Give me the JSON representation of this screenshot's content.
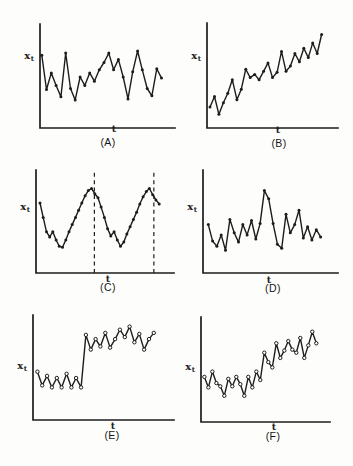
{
  "figure": {
    "caption_fragment": "Figure",
    "ink_color": "#1d1d1d",
    "background_color": "#fdfdfc"
  },
  "chart_data": [
    {
      "panel": "A",
      "panel_label": "(A)",
      "type": "line",
      "xlabel": "t",
      "ylabel": "xt",
      "ylabel_base": "x",
      "ylabel_sub": "t",
      "marker": "filled-dot",
      "grid": false,
      "coords": "fractions of axis: x 0=origin to 1=right end, y 0=baseline to 1=axis top",
      "axis": {
        "x_left": 40,
        "y_top": 24,
        "y_bottom": 128,
        "x_right": 175
      },
      "x": [
        0.013,
        0.048,
        0.084,
        0.119,
        0.155,
        0.19,
        0.226,
        0.261,
        0.297,
        0.332,
        0.368,
        0.403,
        0.439,
        0.474,
        0.51,
        0.545,
        0.581,
        0.616,
        0.652,
        0.687,
        0.723,
        0.758,
        0.794,
        0.829,
        0.865,
        0.9
      ],
      "y": [
        0.7,
        0.37,
        0.53,
        0.41,
        0.3,
        0.72,
        0.38,
        0.27,
        0.49,
        0.41,
        0.53,
        0.45,
        0.56,
        0.63,
        0.72,
        0.56,
        0.66,
        0.49,
        0.28,
        0.54,
        0.74,
        0.56,
        0.38,
        0.31,
        0.57,
        0.48
      ]
    },
    {
      "panel": "B",
      "panel_label": "(B)",
      "type": "line",
      "xlabel": "t",
      "ylabel": "xt",
      "ylabel_base": "x",
      "ylabel_sub": "t",
      "marker": "filled-dot",
      "grid": false,
      "axis": {
        "x_left": 207,
        "y_top": 23,
        "y_bottom": 128,
        "x_right": 338
      },
      "x": [
        0.023,
        0.057,
        0.091,
        0.125,
        0.159,
        0.193,
        0.228,
        0.262,
        0.296,
        0.33,
        0.364,
        0.398,
        0.432,
        0.466,
        0.5,
        0.535,
        0.569,
        0.603,
        0.637,
        0.671,
        0.705,
        0.739,
        0.773,
        0.807,
        0.841,
        0.875
      ],
      "y": [
        0.2,
        0.3,
        0.13,
        0.24,
        0.33,
        0.46,
        0.27,
        0.37,
        0.56,
        0.48,
        0.51,
        0.46,
        0.54,
        0.62,
        0.48,
        0.53,
        0.73,
        0.54,
        0.59,
        0.71,
        0.63,
        0.76,
        0.67,
        0.81,
        0.71,
        0.89
      ]
    },
    {
      "panel": "C",
      "panel_label": "(C)",
      "type": "line",
      "xlabel": "t",
      "ylabel": "xt",
      "ylabel_base": "x",
      "ylabel_sub": "t",
      "marker": "filled-dot",
      "grid": false,
      "dashed_lines_x": [
        0.423,
        0.854
      ],
      "axis": {
        "x_left": 36,
        "y_top": 170,
        "y_bottom": 273,
        "x_right": 174
      },
      "x": [
        0.029,
        0.052,
        0.076,
        0.099,
        0.122,
        0.146,
        0.169,
        0.192,
        0.216,
        0.239,
        0.262,
        0.286,
        0.309,
        0.332,
        0.356,
        0.379,
        0.402,
        0.426,
        0.449,
        0.472,
        0.496,
        0.519,
        0.542,
        0.566,
        0.589,
        0.612,
        0.636,
        0.659,
        0.682,
        0.706,
        0.729,
        0.752,
        0.776,
        0.799,
        0.822,
        0.846,
        0.869,
        0.893
      ],
      "y": [
        0.68,
        0.54,
        0.4,
        0.35,
        0.4,
        0.32,
        0.26,
        0.25,
        0.32,
        0.4,
        0.47,
        0.54,
        0.61,
        0.68,
        0.75,
        0.8,
        0.82,
        0.77,
        0.73,
        0.64,
        0.54,
        0.43,
        0.36,
        0.4,
        0.32,
        0.26,
        0.3,
        0.38,
        0.45,
        0.52,
        0.59,
        0.67,
        0.74,
        0.79,
        0.82,
        0.76,
        0.71,
        0.67
      ]
    },
    {
      "panel": "D",
      "panel_label": "(D)",
      "type": "line",
      "xlabel": "t",
      "ylabel": "xt",
      "ylabel_base": "x",
      "ylabel_sub": "t",
      "marker": "filled-dot",
      "grid": false,
      "axis": {
        "x_left": 203,
        "y_top": 170,
        "y_bottom": 273,
        "x_right": 338
      },
      "x": [
        0.039,
        0.071,
        0.103,
        0.135,
        0.167,
        0.199,
        0.231,
        0.263,
        0.295,
        0.327,
        0.359,
        0.391,
        0.423,
        0.455,
        0.487,
        0.519,
        0.551,
        0.583,
        0.615,
        0.647,
        0.679,
        0.711,
        0.743,
        0.775,
        0.807,
        0.839,
        0.871
      ],
      "y": [
        0.47,
        0.31,
        0.26,
        0.37,
        0.22,
        0.52,
        0.39,
        0.3,
        0.47,
        0.37,
        0.51,
        0.33,
        0.48,
        0.8,
        0.72,
        0.48,
        0.28,
        0.24,
        0.57,
        0.39,
        0.47,
        0.61,
        0.34,
        0.45,
        0.32,
        0.42,
        0.35
      ]
    },
    {
      "panel": "E",
      "panel_label": "(E)",
      "type": "line",
      "xlabel": "t",
      "ylabel": "xt",
      "ylabel_base": "x",
      "ylabel_sub": "t",
      "marker": "open-circle",
      "grid": false,
      "axis": {
        "x_left": 33,
        "y_top": 315,
        "y_bottom": 420,
        "x_right": 174
      },
      "x": [
        0.031,
        0.065,
        0.1,
        0.134,
        0.169,
        0.203,
        0.238,
        0.272,
        0.306,
        0.341,
        0.375,
        0.41,
        0.444,
        0.478,
        0.513,
        0.547,
        0.582,
        0.616,
        0.651,
        0.685,
        0.719,
        0.754,
        0.788,
        0.823,
        0.857
      ],
      "y": [
        0.46,
        0.33,
        0.42,
        0.31,
        0.4,
        0.31,
        0.44,
        0.31,
        0.4,
        0.31,
        0.81,
        0.67,
        0.77,
        0.7,
        0.83,
        0.69,
        0.77,
        0.86,
        0.79,
        0.89,
        0.74,
        0.82,
        0.67,
        0.77,
        0.83
      ]
    },
    {
      "panel": "F",
      "panel_label": "(F)",
      "type": "line",
      "xlabel": "t",
      "ylabel": "xt",
      "ylabel_base": "x",
      "ylabel_sub": "t",
      "marker": "open-circle",
      "grid": false,
      "axis": {
        "x_left": 201,
        "y_top": 317,
        "y_bottom": 422,
        "x_right": 330
      },
      "x": [
        0.026,
        0.057,
        0.088,
        0.119,
        0.15,
        0.181,
        0.212,
        0.243,
        0.274,
        0.305,
        0.336,
        0.367,
        0.398,
        0.429,
        0.46,
        0.491,
        0.522,
        0.553,
        0.584,
        0.615,
        0.646,
        0.677,
        0.708,
        0.739,
        0.77,
        0.801,
        0.832,
        0.863,
        0.894
      ],
      "y": [
        0.43,
        0.33,
        0.48,
        0.37,
        0.34,
        0.25,
        0.41,
        0.34,
        0.43,
        0.36,
        0.25,
        0.43,
        0.33,
        0.48,
        0.4,
        0.66,
        0.57,
        0.52,
        0.75,
        0.61,
        0.68,
        0.77,
        0.69,
        0.66,
        0.8,
        0.61,
        0.73,
        0.86,
        0.75
      ]
    }
  ]
}
